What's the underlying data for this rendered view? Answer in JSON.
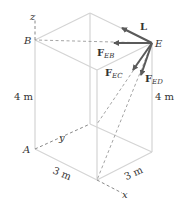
{
  "diagram": {
    "type": "3d-box-force-diagram",
    "points": {
      "A": "A",
      "B": "B",
      "E": "E"
    },
    "axes": {
      "x": "x",
      "y": "y",
      "z": "z"
    },
    "dimensions": {
      "height_left": "4 m",
      "height_right": "4 m",
      "width_front_left": "3 m",
      "width_front_right": "3 m"
    },
    "forces": {
      "L": "L",
      "F_EB_main": "F",
      "F_EB_sub": "EB",
      "F_EC_main": "F",
      "F_EC_sub": "EC",
      "F_ED_main": "F",
      "F_ED_sub": "ED"
    },
    "colors": {
      "edge": "#d4d4d4",
      "force": "#5a5a5a",
      "text": "#333333"
    }
  }
}
